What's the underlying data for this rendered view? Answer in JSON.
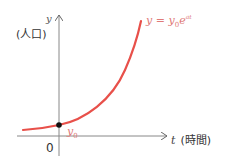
{
  "diagram": {
    "y_axis_label": "y",
    "y_axis_caption": "(人口)",
    "x_axis_label": "t",
    "x_axis_caption": "(時間)",
    "origin_label": "0",
    "intercept_label": "y",
    "intercept_sub": "0",
    "equation": {
      "lhs": "y",
      "eq": " = ",
      "base": "y",
      "base_sub": "0",
      "exp_base": "e",
      "exponent": "at"
    },
    "colors": {
      "curve": "#e8504a",
      "axis": "#777777",
      "equation": "#e07a78",
      "point": "#111111"
    }
  }
}
